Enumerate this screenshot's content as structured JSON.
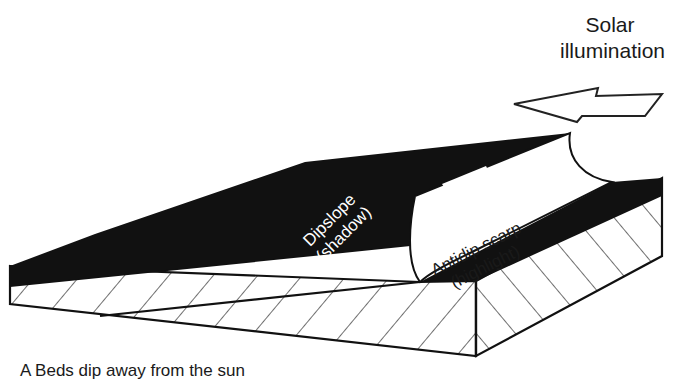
{
  "figure": {
    "caption": "A  Beds dip away from the sun",
    "solar_label_line1": "Solar",
    "solar_label_line2": "illumination",
    "dipslope_label_line1": "Dipslope",
    "dipslope_label_line2": "(shadow)",
    "scarp_label_line1": "Antidip scarp",
    "scarp_label_line2": "(highlight)"
  },
  "icons": {
    "arrow": "left-arrow-outline",
    "strike_dip": "strike-dip-symbol"
  },
  "colors": {
    "ink": "#111111",
    "paper": "#ffffff"
  }
}
